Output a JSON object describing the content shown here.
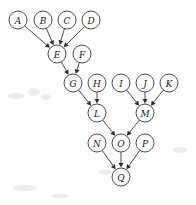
{
  "diagram": {
    "type": "dag",
    "background_color": "#fdfdfd",
    "node_stroke_color": "#3a3a3a",
    "edge_stroke_color": "#3a3a3a",
    "arrow_fill_color": "#2e2e2e",
    "label_color": "#1c1c1c",
    "node_radius": 9,
    "width": 196,
    "height": 205,
    "nodes": [
      {
        "id": "A",
        "label": "A",
        "cx": 18,
        "cy": 20
      },
      {
        "id": "B",
        "label": "B",
        "cx": 43,
        "cy": 20
      },
      {
        "id": "C",
        "label": "C",
        "cx": 67,
        "cy": 20
      },
      {
        "id": "D",
        "label": "D",
        "cx": 91,
        "cy": 20
      },
      {
        "id": "E",
        "label": "E",
        "cx": 57,
        "cy": 54
      },
      {
        "id": "F",
        "label": "F",
        "cx": 82,
        "cy": 54
      },
      {
        "id": "G",
        "label": "G",
        "cx": 73,
        "cy": 83
      },
      {
        "id": "H",
        "label": "H",
        "cx": 97,
        "cy": 83
      },
      {
        "id": "I",
        "label": "I",
        "cx": 121,
        "cy": 83
      },
      {
        "id": "J",
        "label": "J",
        "cx": 145,
        "cy": 83
      },
      {
        "id": "K",
        "label": "K",
        "cx": 169,
        "cy": 83
      },
      {
        "id": "L",
        "label": "L",
        "cx": 97,
        "cy": 113
      },
      {
        "id": "M",
        "label": "M",
        "cx": 145,
        "cy": 113
      },
      {
        "id": "N",
        "label": "N",
        "cx": 97,
        "cy": 143
      },
      {
        "id": "O",
        "label": "O",
        "cx": 121,
        "cy": 143
      },
      {
        "id": "P",
        "label": "P",
        "cx": 145,
        "cy": 143
      },
      {
        "id": "Q",
        "label": "Q",
        "cx": 121,
        "cy": 177
      }
    ],
    "edges": [
      {
        "from": "A",
        "to": "E"
      },
      {
        "from": "B",
        "to": "E"
      },
      {
        "from": "C",
        "to": "E"
      },
      {
        "from": "D",
        "to": "E"
      },
      {
        "from": "E",
        "to": "G"
      },
      {
        "from": "F",
        "to": "G"
      },
      {
        "from": "G",
        "to": "L"
      },
      {
        "from": "H",
        "to": "L"
      },
      {
        "from": "I",
        "to": "M"
      },
      {
        "from": "J",
        "to": "M"
      },
      {
        "from": "K",
        "to": "M"
      },
      {
        "from": "L",
        "to": "O"
      },
      {
        "from": "M",
        "to": "O"
      },
      {
        "from": "N",
        "to": "Q"
      },
      {
        "from": "O",
        "to": "Q"
      },
      {
        "from": "P",
        "to": "Q"
      }
    ],
    "specks": [
      {
        "cx": 16,
        "cy": 96,
        "rx": 9,
        "ry": 3
      },
      {
        "cx": 34,
        "cy": 92,
        "rx": 6,
        "ry": 4
      },
      {
        "cx": 46,
        "cy": 97,
        "rx": 5,
        "ry": 3
      },
      {
        "cx": 25,
        "cy": 188,
        "rx": 12,
        "ry": 3
      },
      {
        "cx": 60,
        "cy": 196,
        "rx": 8,
        "ry": 2
      },
      {
        "cx": 180,
        "cy": 150,
        "rx": 7,
        "ry": 3
      },
      {
        "cx": 105,
        "cy": 172,
        "rx": 6,
        "ry": 3
      }
    ]
  }
}
